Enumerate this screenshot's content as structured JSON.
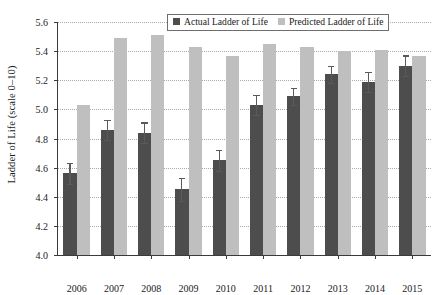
{
  "chart_data": {
    "type": "bar",
    "title": "",
    "subtitle": "",
    "xlabel": "",
    "ylabel": "Ladder of Life (scale 0–10)",
    "categories": [
      "2006",
      "2007",
      "2008",
      "2009",
      "2010",
      "2011",
      "2012",
      "2013",
      "2014",
      "2015"
    ],
    "ylim": [
      4.0,
      5.6
    ],
    "y_ticks": [
      "4.0",
      "4.2",
      "4.4",
      "4.6",
      "4.8",
      "5.0",
      "5.2",
      "5.4",
      "5.6"
    ],
    "y_tick_values": [
      4.0,
      4.2,
      4.4,
      4.6,
      4.8,
      5.0,
      5.2,
      5.4,
      5.6
    ],
    "grid": true,
    "grid_axis": "y",
    "grid_style": "dotted",
    "legend_position": "top-right-inside",
    "series": [
      {
        "name": "Actual Ladder of Life",
        "color": "#4d4d4d",
        "values": [
          4.56,
          4.86,
          4.84,
          4.45,
          4.65,
          5.03,
          5.09,
          5.24,
          5.19,
          5.3
        ],
        "errors": [
          0.07,
          0.07,
          0.07,
          0.08,
          0.07,
          0.07,
          0.06,
          0.06,
          0.07,
          0.07
        ]
      },
      {
        "name": "Predicted Ladder of Life",
        "color": "#bfbfbf",
        "values": [
          5.03,
          5.49,
          5.51,
          5.43,
          5.37,
          5.45,
          5.43,
          5.4,
          5.41,
          5.37
        ],
        "errors": [
          0,
          0,
          0,
          0,
          0,
          0,
          0,
          0,
          0,
          0
        ]
      }
    ]
  },
  "legend": {
    "items": [
      {
        "label": "Actual Ladder of Life",
        "color": "#4d4d4d"
      },
      {
        "label": "Predicted Ladder of Life",
        "color": "#bfbfbf"
      }
    ]
  },
  "axes": {
    "y_title": "Ladder of Life (scale 0–10)"
  }
}
